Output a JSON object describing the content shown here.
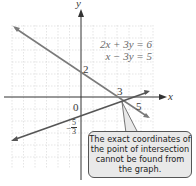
{
  "equations": {
    "line1": "2x + 3y = 6",
    "line2": "x − 3y = 5"
  },
  "axes": {
    "x_label": "x",
    "y_label": "y",
    "origin_label": "0"
  },
  "labels": {
    "y_intercept_line1": "2",
    "x_intercept_line1": "3",
    "x_intercept_line2": "5",
    "y_intercept_line2_sign": "−",
    "y_intercept_line2_num": "5",
    "y_intercept_line2_den": "3"
  },
  "callout": {
    "text": "The exact coordinates of the point of intersection cannot be found from the graph."
  },
  "colors": {
    "grid": "#d0d0d0",
    "axis": "#333333",
    "line1": "#7a7a7a",
    "line2": "#555555",
    "callout_bg": "#e9e9e9"
  }
}
